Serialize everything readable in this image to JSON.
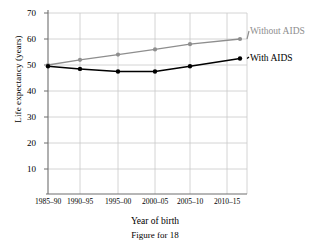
{
  "caption": "Figure for 18",
  "chart_data": {
    "type": "line",
    "title": "",
    "xlabel": "Year of birth",
    "ylabel": "Life expectancy (years)",
    "categories": [
      "1985–90",
      "1990–95",
      "1995–00",
      "2000–05",
      "2005–10",
      "2010–15"
    ],
    "yticks": [
      10,
      20,
      30,
      40,
      50,
      60,
      70
    ],
    "ylim": [
      0,
      70
    ],
    "grid": true,
    "legend_position": "right-inline",
    "series": [
      {
        "name": "Without AIDS",
        "color": "#8e8e8e",
        "values": [
          50.0,
          52.0,
          54.0,
          56.0,
          58.0,
          60.0
        ]
      },
      {
        "name": "With AIDS",
        "color": "#000000",
        "values": [
          49.5,
          48.5,
          47.5,
          47.5,
          49.5,
          52.5
        ]
      }
    ]
  },
  "axis": {
    "y_tick_labels": [
      "70",
      "60",
      "50",
      "40",
      "30",
      "20",
      "10"
    ],
    "x_tick_labels": [
      "1985–90",
      "1990–95",
      "1995–00",
      "2000–05",
      "2005–10",
      "2010–15"
    ]
  },
  "legend": {
    "without_aids": "Without AIDS",
    "with_aids": "With AIDS"
  },
  "colors": {
    "without_aids": "#8e8e8e",
    "with_aids": "#000000",
    "grid": "#c9c9c9",
    "axis": "#7a7a7a"
  }
}
